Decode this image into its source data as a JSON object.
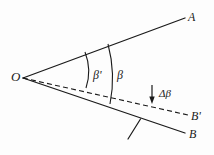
{
  "figure": {
    "background_color": "#fdfdfd",
    "stroke_color": "#1a1a1a",
    "labels": {
      "vertex": "O",
      "ray_upper": "A",
      "ray_reference_dashed": "B'",
      "ray_lower_solid": "B",
      "angle_inner": "β'",
      "angle_outer": "β",
      "angle_difference": "Δβ"
    },
    "geometry": {
      "vertex_point": [
        23,
        78
      ],
      "ray_upper_end": [
        185,
        18
      ],
      "ray_dashed_end": [
        188,
        115
      ],
      "ray_solid_end": [
        185,
        133
      ],
      "arc_inner_top": [
        85,
        52
      ],
      "arc_inner_bottom": [
        86,
        88
      ],
      "arc_outer_top": [
        108,
        44
      ],
      "arc_outer_bottom": [
        110,
        104
      ],
      "delta_arrow_from": [
        152,
        85
      ],
      "delta_arrow_to": [
        152,
        103
      ],
      "hatch_from": [
        128,
        139
      ],
      "hatch_to": [
        140,
        119
      ]
    },
    "line_styles": {
      "ray_upper": "solid",
      "ray_dashed": "dashed",
      "ray_solid": "solid",
      "arcs": "solid",
      "delta_arrow": "solid-with-arrowhead",
      "hatch": "solid"
    }
  }
}
